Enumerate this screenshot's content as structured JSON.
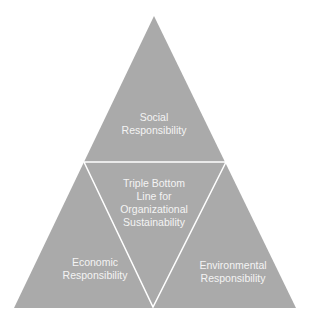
{
  "diagram": {
    "type": "triangle-of-triangles",
    "colors": {
      "fill": "#aaaaaa",
      "divider": "#ffffff",
      "text": "#f4f4f4",
      "background": "#ffffff"
    },
    "top": {
      "line1": "Social",
      "line2": "Responsibility"
    },
    "center": {
      "line1": "Triple Bottom",
      "line2": "Line for",
      "line3": "Organizational",
      "line4": "Sustainability"
    },
    "left": {
      "line1": "Economic",
      "line2": "Responsibility"
    },
    "right": {
      "line1": "Environmental",
      "line2": "Responsibility"
    }
  }
}
